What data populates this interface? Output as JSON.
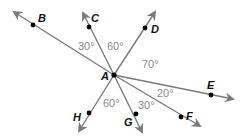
{
  "diagram": {
    "vertex": {
      "label": "A",
      "x": 114,
      "y": 75
    },
    "colors": {
      "ray": "#7a7a7a",
      "point": "#000000",
      "angle_text": "#8a8a8a",
      "label_text": "#111111"
    },
    "rays": [
      {
        "label": "B",
        "tip": [
          14,
          12
        ],
        "point": [
          33,
          25
        ],
        "label_pos": [
          38,
          22
        ]
      },
      {
        "label": "C",
        "tip": [
          83,
          13
        ],
        "point": [
          89,
          27
        ],
        "label_pos": [
          91,
          22
        ]
      },
      {
        "label": "D",
        "tip": [
          155,
          12
        ],
        "point": [
          145,
          28
        ],
        "label_pos": [
          151,
          33
        ]
      },
      {
        "label": "E",
        "tip": [
          233,
          99
        ],
        "point": [
          211,
          95
        ],
        "label_pos": [
          207,
          89
        ]
      },
      {
        "label": "F",
        "tip": [
          200,
          126
        ],
        "point": [
          181,
          117
        ],
        "label_pos": [
          186,
          120
        ]
      },
      {
        "label": "G",
        "tip": [
          142,
          132
        ],
        "point": [
          136,
          114
        ],
        "label_pos": [
          124,
          126
        ]
      },
      {
        "label": "H",
        "tip": [
          79,
          131
        ],
        "point": [
          89,
          113
        ],
        "label_pos": [
          73,
          121
        ]
      }
    ],
    "angles": [
      {
        "text": "30°",
        "between": [
          "B",
          "C"
        ],
        "pos": [
          78,
          50
        ]
      },
      {
        "text": "60°",
        "between": [
          "C",
          "D"
        ],
        "pos": [
          107,
          50
        ]
      },
      {
        "text": "70°",
        "between": [
          "D",
          "E"
        ],
        "pos": [
          142,
          68
        ]
      },
      {
        "text": "20°",
        "between": [
          "E",
          "F"
        ],
        "pos": [
          157,
          97
        ]
      },
      {
        "text": "30°",
        "between": [
          "F",
          "G"
        ],
        "pos": [
          138,
          109
        ]
      },
      {
        "text": "60°",
        "between": [
          "G",
          "H"
        ],
        "pos": [
          103,
          107
        ]
      }
    ]
  }
}
